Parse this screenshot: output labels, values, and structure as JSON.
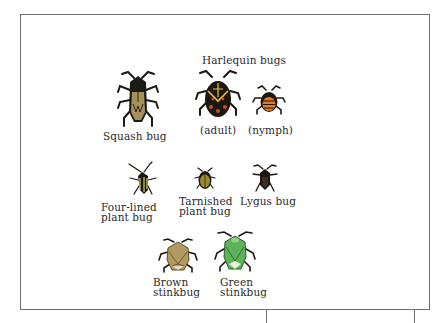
{
  "figure": {
    "group_title": "Harlequin bugs",
    "bugs": [
      {
        "id": "squash-bug",
        "label": "Squash bug"
      },
      {
        "id": "harlequin-adult",
        "label": "(adult)"
      },
      {
        "id": "harlequin-nymph",
        "label": "(nymph)"
      },
      {
        "id": "four-lined-plant-bug",
        "label_line1": "Four-lined",
        "label_line2": "plant bug"
      },
      {
        "id": "tarnished-plant-bug",
        "label_line1": "Tarnished",
        "label_line2": "plant bug"
      },
      {
        "id": "lygus-bug",
        "label": "Lygus bug"
      },
      {
        "id": "brown-stinkbug",
        "label_line1": "Brown",
        "label_line2": "stinkbug"
      },
      {
        "id": "green-stinkbug",
        "label_line1": "Green",
        "label_line2": "stinkbug"
      }
    ]
  },
  "colors": {
    "frame": "#6e6e6e",
    "text": "#2a2a2a",
    "squash_body": "#1c1a16",
    "squash_wings": "#a8905c",
    "harlequin_body": "#1e1710",
    "harlequin_stripe": "#e8c43c",
    "harlequin_spots": "#c0502a",
    "nymph_orange": "#e27a2a",
    "fourlined_yellow": "#d8cf70",
    "tarnished_olive": "#9a8a2a",
    "lygus_brown": "#3c3020",
    "brown_stink": "#b09a62",
    "green_stink": "#5cb35a"
  }
}
